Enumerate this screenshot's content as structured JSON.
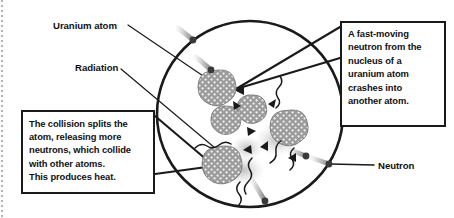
{
  "figure": {
    "background_color": "#ffffff",
    "ink_color": "#1a1a1a",
    "atom_fill_color": "#9b9b9b",
    "nucleon_color": "#ffffff",
    "glow_color": "#c9c9c9"
  },
  "labels": {
    "uranium_atom": "Uranium atom",
    "radiation": "Radiation",
    "neutron": "Neutron"
  },
  "callouts": {
    "right": {
      "text": "A fast-moving neutron from the nucleus of a uranium atom crashes into another atom.",
      "lines": [
        "A fast-moving",
        "neutron from the",
        "nucleus of a",
        "uranium atom",
        "crashes into",
        "another atom."
      ]
    },
    "left": {
      "text": "The collision splits the atom, releasing more neutrons, which collide with other atoms. This produces heat.",
      "lines": [
        "The collision splits the",
        "atom, releasing more",
        "neutrons, which collide",
        "with other atoms.",
        "This produces heat."
      ]
    }
  },
  "diagram": {
    "reaction_circle": {
      "cx": 250,
      "cy": 114,
      "r": 93
    },
    "atoms": [
      {
        "name": "uranium-atom-struck",
        "cx": 219,
        "cy": 88,
        "r": 17
      },
      {
        "name": "fragment-upper",
        "cx": 253,
        "cy": 109,
        "r": 14
      },
      {
        "name": "fragment-lower",
        "cx": 227,
        "cy": 120,
        "r": 14
      },
      {
        "name": "atom-right",
        "cx": 291,
        "cy": 128,
        "r": 17
      },
      {
        "name": "atom-lower-left",
        "cx": 224,
        "cy": 165,
        "r": 18
      }
    ],
    "neutrons": [
      {
        "name": "neutron-incoming-top",
        "x": 193,
        "y": 40
      },
      {
        "name": "neutron-incoming-upper",
        "x": 210,
        "y": 69
      },
      {
        "name": "neutron-outgoing-right-inner",
        "x": 305,
        "y": 155
      },
      {
        "name": "neutron-outgoing-right-outer",
        "x": 328,
        "y": 163
      },
      {
        "name": "neutron-outgoing-bottom",
        "x": 265,
        "y": 202
      }
    ],
    "radiation_waves": 6,
    "recoil_arrows": 6
  }
}
